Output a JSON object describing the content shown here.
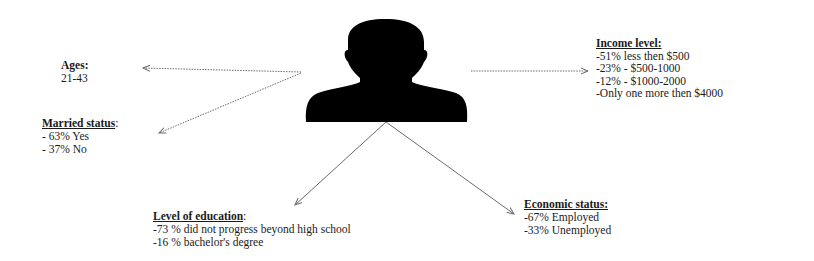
{
  "diagram": {
    "center_icon": "person-silhouette-icon",
    "colors": {
      "text": "#1a1a1a",
      "silhouette": "#000000",
      "arrow": "#6b6b6b",
      "background": "#ffffff"
    },
    "blocks": {
      "ages": {
        "heading": "Ages:",
        "items": [
          "21-43"
        ]
      },
      "married": {
        "heading": "Married status",
        "heading_suffix": ":",
        "items": [
          "- 63% Yes",
          "- 37% No"
        ]
      },
      "income": {
        "heading": "Income level:",
        "items": [
          "-51% less then $500",
          "-23% - $500-1000",
          "-12% - $1000-2000",
          "-Only one more then $4000"
        ]
      },
      "education": {
        "heading": "Level of education",
        "heading_suffix": ":",
        "items": [
          "-73 % did not progress beyond high school",
          "-16 % bachelor's degree"
        ]
      },
      "economic": {
        "heading": "Economic status:",
        "items": [
          "-67% Employed",
          "-33% Unemployed"
        ]
      }
    }
  }
}
